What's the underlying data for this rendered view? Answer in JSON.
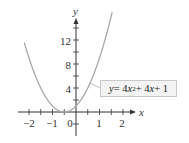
{
  "chart_data": {
    "type": "line",
    "title": "",
    "xlabel": "x",
    "ylabel": "y",
    "xlim": [
      -2.3,
      2.3
    ],
    "ylim": [
      -3,
      16
    ],
    "x_ticks": [
      -2,
      -1,
      0,
      1,
      2
    ],
    "x_minor_step": 0.5,
    "y_ticks": [
      4,
      8,
      12
    ],
    "y_minor_step": 2,
    "grid": false,
    "series": [
      {
        "name": "y = 4x^2 + 4x + 1",
        "equation": "y = 4x^2 + 4x + 1",
        "color": "#a8a8a8",
        "x": [
          -2.2,
          -2.0,
          -1.5,
          -1.0,
          -0.5,
          0.0,
          0.5,
          1.0,
          1.5
        ],
        "values": [
          13.69,
          9,
          4,
          1,
          0,
          1,
          4,
          9,
          16
        ]
      }
    ],
    "annotations": [
      {
        "text": "y = 4x² + 4x + 1",
        "position": "right of curve near (0.8, 6)",
        "boxed": true
      }
    ]
  },
  "labels": {
    "x_axis": "x",
    "y_axis": "y",
    "x_ticks": [
      "−2",
      "−1",
      "0",
      "1",
      "2"
    ],
    "y_ticks": [
      "4",
      "8",
      "12"
    ],
    "equation": {
      "y": "y",
      "eq1": " = 4",
      "x1": "x",
      "exp": "2",
      "eq2": " + 4",
      "x2": "x",
      "eq3": " + 1"
    }
  }
}
